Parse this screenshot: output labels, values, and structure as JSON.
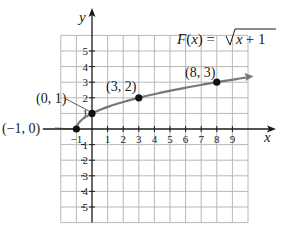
{
  "chart_data": {
    "type": "line",
    "title": "",
    "function_label": "F(x) = √(x + 1)",
    "function_parts": {
      "name": "F",
      "arg": "x",
      "eq": "=",
      "radicand_var": "x",
      "radicand_rest": "+ 1"
    },
    "xlabel": "x",
    "ylabel": "y",
    "xlim": [
      -2,
      10
    ],
    "ylim": [
      -6,
      6
    ],
    "grid": true,
    "x_ticks": [
      -1,
      1,
      2,
      3,
      4,
      5,
      6,
      7,
      8,
      9
    ],
    "x_tick_labels": [
      "−1",
      "1",
      "2",
      "3",
      "4",
      "5",
      "6",
      "7",
      "8",
      "9"
    ],
    "y_ticks": [
      5,
      4,
      3,
      2,
      1,
      -1,
      -2,
      -3,
      -4,
      -5
    ],
    "y_tick_labels": [
      "5",
      "4",
      "3",
      "2",
      "1",
      "1",
      "2",
      "3",
      "4",
      "5"
    ],
    "series": [
      {
        "name": "F(x) = √(x + 1)",
        "x": [
          -1,
          -0.75,
          -0.5,
          0,
          1,
          2,
          3,
          4,
          5,
          6,
          7,
          8,
          9.9
        ],
        "values": [
          0,
          0.5,
          0.707,
          1,
          1.414,
          1.732,
          2,
          2.236,
          2.449,
          2.646,
          2.828,
          3,
          3.302
        ],
        "color": "#777777"
      }
    ],
    "points": [
      {
        "x": -1,
        "y": 0,
        "label": "(−1, 0)"
      },
      {
        "x": 0,
        "y": 1,
        "label": "(0, 1)"
      },
      {
        "x": 3,
        "y": 2,
        "label": "(3, 2)"
      },
      {
        "x": 8,
        "y": 3,
        "label": "(8, 3)"
      }
    ],
    "annotations": [
      "(−1, 0)",
      "(0, 1)",
      "(3, 2)",
      "(8, 3)"
    ]
  },
  "colors": {
    "grid": "#b8b8b8",
    "axis": "#1a1a1a",
    "curve": "#777777",
    "point": "#111111"
  }
}
